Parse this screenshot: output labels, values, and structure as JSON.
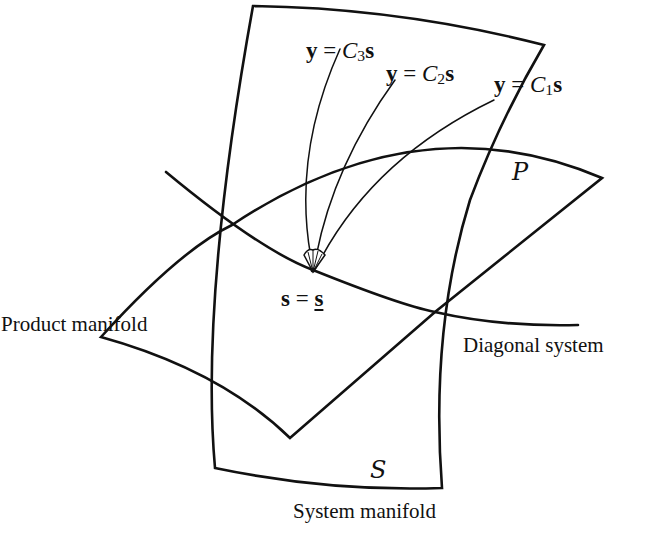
{
  "diagram": {
    "type": "geometric-manifold-diagram",
    "colors": {
      "stroke": "#111111",
      "background": "#ffffff"
    },
    "regions": [
      {
        "id": "system-manifold",
        "symbol": "S",
        "caption": "System manifold"
      },
      {
        "id": "product-manifold",
        "symbol": "P",
        "caption": "Product manifold"
      }
    ],
    "curves": [
      {
        "id": "diagonal-system",
        "caption": "Diagonal system"
      }
    ],
    "point": {
      "lhs": "s",
      "eq": " = ",
      "rhs": "s"
    },
    "fan_curves": [
      {
        "lhs": "y",
        "eq": " = ",
        "coef": "C",
        "sub": "3",
        "var": "s"
      },
      {
        "lhs": "y",
        "eq": " = ",
        "coef": "C",
        "sub": "2",
        "var": "s"
      },
      {
        "lhs": "y",
        "eq": " = ",
        "coef": "C",
        "sub": "1",
        "var": "s"
      }
    ]
  },
  "labels": {
    "system_symbol": "S",
    "product_symbol": "P",
    "system_caption": "System manifold",
    "product_caption": "Product manifold",
    "diagonal_caption": "Diagonal system"
  }
}
